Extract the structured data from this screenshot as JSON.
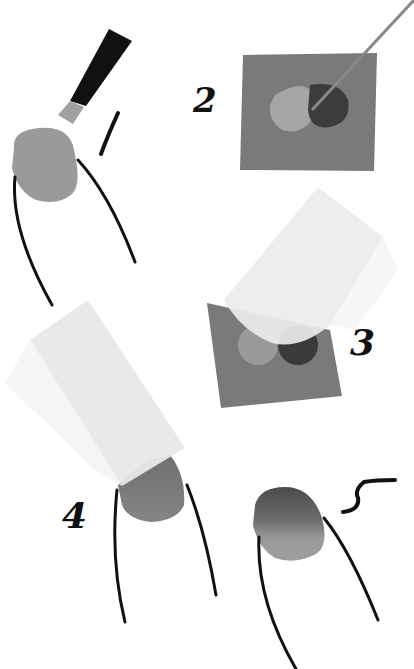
{
  "illustration": {
    "title": "Gradient nail technique steps",
    "steps": [
      {
        "label": "1",
        "description": "apply base polish to nail"
      },
      {
        "label": "2",
        "description": "mix two polish colors on a sponge"
      },
      {
        "label": "3",
        "description": "dab makeup sponge into polish"
      },
      {
        "label": "4",
        "description": "press sponge onto nail"
      },
      {
        "label": "5",
        "description": "finished gradient nail"
      }
    ],
    "colors": {
      "background": "#ffffff",
      "nail_base": "#9a9a9a",
      "sponge_square": "#7a7a7a",
      "polish_light": "#a5a5a5",
      "polish_dark": "#3c3c3c",
      "makeup_sponge": "#ececec",
      "outline": "#111111"
    }
  }
}
